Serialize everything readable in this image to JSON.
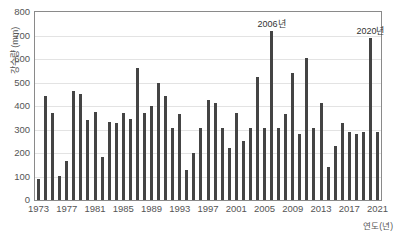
{
  "chart_data": {
    "type": "bar",
    "title": "",
    "xlabel": "연도(년)",
    "ylabel": "강수량 (mm)",
    "ylim": [
      0,
      800
    ],
    "ytick_values": [
      0,
      100,
      200,
      300,
      400,
      500,
      600,
      700,
      800
    ],
    "ytick_labels": [
      "0",
      "100",
      "200",
      "300",
      "400",
      "500",
      "600",
      "700",
      "800"
    ],
    "xtick_labels": [
      "1973",
      "1977",
      "1981",
      "1985",
      "1989",
      "1993",
      "1997",
      "2001",
      "2005",
      "2009",
      "2013",
      "2017",
      "2021"
    ],
    "grid": true,
    "legend": "none",
    "categories": [
      "1973",
      "1974",
      "1975",
      "1976",
      "1977",
      "1978",
      "1979",
      "1980",
      "1981",
      "1982",
      "1983",
      "1984",
      "1985",
      "1986",
      "1987",
      "1988",
      "1989",
      "1990",
      "1991",
      "1992",
      "1993",
      "1994",
      "1995",
      "1996",
      "1997",
      "1998",
      "1999",
      "2000",
      "2001",
      "2002",
      "2003",
      "2004",
      "2005",
      "2006",
      "2007",
      "2008",
      "2009",
      "2010",
      "2011",
      "2012",
      "2013",
      "2014",
      "2015",
      "2016",
      "2017",
      "2018",
      "2019",
      "2020",
      "2021"
    ],
    "values": [
      88,
      443,
      370,
      103,
      168,
      462,
      452,
      341,
      373,
      183,
      330,
      328,
      370,
      345,
      562,
      369,
      402,
      496,
      443,
      306,
      368,
      126,
      200,
      306,
      425,
      412,
      305,
      222,
      370,
      253,
      305,
      523,
      305,
      718,
      305,
      368,
      540,
      279,
      605,
      305,
      411,
      140,
      229,
      326,
      288,
      279,
      288,
      688,
      289
    ],
    "annotations": [
      {
        "label": "2006년",
        "category": "2006",
        "value": 718
      },
      {
        "label": "2020년",
        "category": "2020",
        "value": 688
      }
    ]
  },
  "caption": {
    "text": ""
  }
}
